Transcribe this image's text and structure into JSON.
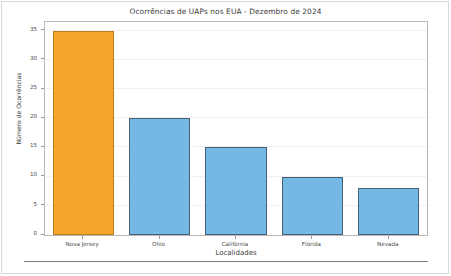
{
  "page": {
    "background_color": "#ffffff",
    "frame_color": "#d8d8d8",
    "bottom_rule_color": "#7d7d7d"
  },
  "chart_data": {
    "type": "bar",
    "title": "Ocorrências de UAPs nos EUA - Dezembro de 2024",
    "xlabel": "Localidades",
    "ylabel": "Número de Ocorrências",
    "categories": [
      "Nova Jersey",
      "Ohio",
      "Califórnia",
      "Flórida",
      "Nevada"
    ],
    "values": [
      35,
      20,
      15,
      10,
      8
    ],
    "ylim": [
      0,
      36.5
    ],
    "yticks": [
      0,
      5,
      10,
      15,
      20,
      25,
      30,
      35
    ],
    "ytick_labels": [
      "0",
      "5",
      "10",
      "15",
      "20",
      "25",
      "30",
      "35"
    ],
    "grid": true,
    "legend": "none",
    "bar_colors": [
      "#f5a52a",
      "#74b8e6",
      "#74b8e6",
      "#74b8e6",
      "#74b8e6"
    ],
    "bar_edge_colors": [
      "#c07d1c",
      "#4a5f72",
      "#4a5f72",
      "#4a5f72",
      "#4a5f72"
    ],
    "highlight_color": "#f5a52a",
    "series_color": "#74b8e6",
    "gridline_color": "#f0f0f0",
    "axis_color": "#b9b9b9"
  }
}
